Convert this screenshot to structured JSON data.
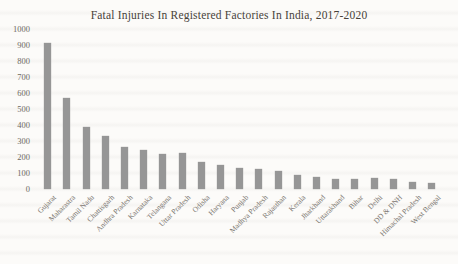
{
  "chart_data": {
    "type": "bar",
    "title": "Fatal Injuries In Registered Factories In India, 2017-2020",
    "categories": [
      "Gujarat",
      "Maharastra",
      "Tamil Nadu",
      "Chattisgarh",
      "Andhra Pradesh",
      "Karnataka",
      "Telangana",
      "Uttar Pradesh",
      "Odisha",
      "Haryana",
      "Punjab",
      "Madhya Pradesh",
      "Rajasthan",
      "Kerala",
      "Jharkhand",
      "Uttarakhand",
      "Bihar",
      "Delhi",
      "DD & DNH",
      "Himachal Pradesh",
      "West Bengal"
    ],
    "values": [
      915,
      570,
      390,
      330,
      260,
      245,
      220,
      222,
      168,
      152,
      130,
      124,
      115,
      90,
      75,
      63,
      63,
      66,
      63,
      45,
      40
    ],
    "xlabel": "",
    "ylabel": "",
    "ylim": [
      0,
      1000
    ],
    "yticks": [
      0,
      100,
      200,
      300,
      400,
      500,
      600,
      700,
      800,
      900,
      1000
    ],
    "grid": false,
    "legend": "none",
    "x_tick_rotation_deg": 45,
    "bar_color": "#969696",
    "title_color": "#474239",
    "ytick_color": "#6f6a64",
    "xtick_color": "#7b7670",
    "background_color": "#fcfbf9"
  }
}
